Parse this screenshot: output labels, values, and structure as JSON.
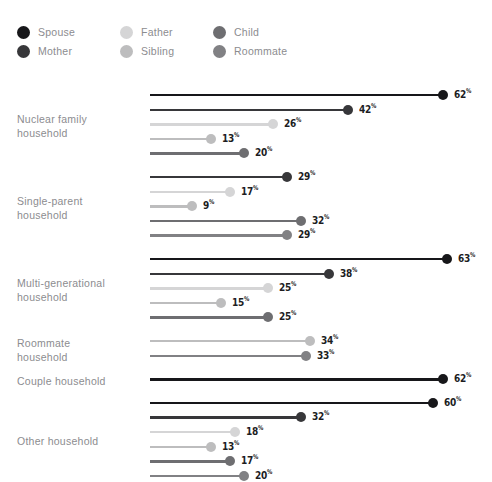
{
  "top_strip": {
    "ghost_text": "— — — —   — — —"
  },
  "legend": {
    "items": [
      {
        "name": "Spouse",
        "color": "#17171a",
        "col": 0,
        "row": 0
      },
      {
        "name": "Mother",
        "color": "#37373a",
        "col": 0,
        "row": 1
      },
      {
        "name": "Father",
        "color": "#d5d5d6",
        "col": 1,
        "row": 0
      },
      {
        "name": "Sibling",
        "color": "#bdbdbe",
        "col": 1,
        "row": 1
      },
      {
        "name": "Child",
        "color": "#6e6e71",
        "col": 2,
        "row": 0
      },
      {
        "name": "Roommate",
        "color": "#818184",
        "col": 2,
        "row": 1
      }
    ]
  },
  "chart_data": {
    "type": "bar",
    "subtype": "lollipop",
    "title": "",
    "xlabel": "",
    "ylabel": "",
    "unit": "%",
    "xlim": [
      0,
      63
    ],
    "grid": false,
    "legend_position": "top-left",
    "series": [
      {
        "name": "Spouse",
        "color": "#17171a"
      },
      {
        "name": "Mother",
        "color": "#37373a"
      },
      {
        "name": "Father",
        "color": "#d5d5d6"
      },
      {
        "name": "Sibling",
        "color": "#bdbdbe"
      },
      {
        "name": "Child",
        "color": "#6e6e71"
      },
      {
        "name": "Roommate",
        "color": "#818184"
      }
    ],
    "groups": [
      {
        "label": "Nuclear family household",
        "label_lines": [
          "Nuclear family",
          "household"
        ],
        "bars": [
          {
            "series": "Spouse",
            "value": 62,
            "value_text": "62"
          },
          {
            "series": "Mother",
            "value": 42,
            "value_text": "42"
          },
          {
            "series": "Father",
            "value": 26,
            "value_text": "26"
          },
          {
            "series": "Sibling",
            "value": 13,
            "value_text": "13"
          },
          {
            "series": "Child",
            "value": 20,
            "value_text": "20"
          }
        ]
      },
      {
        "label": "Single-parent household",
        "label_lines": [
          "Single-parent",
          "household"
        ],
        "bars": [
          {
            "series": "Mother",
            "value": 29,
            "value_text": "29"
          },
          {
            "series": "Father",
            "value": 17,
            "value_text": "17"
          },
          {
            "series": "Sibling",
            "value": 9,
            "value_text": "9"
          },
          {
            "series": "Child",
            "value": 32,
            "value_text": "32"
          },
          {
            "series": "Roommate",
            "value": 29,
            "value_text": "29"
          }
        ]
      },
      {
        "label": "Multi-generational household",
        "label_lines": [
          "Multi-generational",
          "household"
        ],
        "bars": [
          {
            "series": "Spouse",
            "value": 63,
            "value_text": "63"
          },
          {
            "series": "Mother",
            "value": 38,
            "value_text": "38"
          },
          {
            "series": "Father",
            "value": 25,
            "value_text": "25"
          },
          {
            "series": "Sibling",
            "value": 15,
            "value_text": "15"
          },
          {
            "series": "Child",
            "value": 25,
            "value_text": "25"
          }
        ]
      },
      {
        "label": "Roommate household",
        "label_lines": [
          "Roommate",
          "household"
        ],
        "bars": [
          {
            "series": "Sibling",
            "value": 34,
            "value_text": "34"
          },
          {
            "series": "Roommate",
            "value": 33,
            "value_text": "33"
          }
        ]
      },
      {
        "label": "Couple household",
        "label_lines": [
          "Couple household"
        ],
        "bars": [
          {
            "series": "Spouse",
            "value": 62,
            "value_text": "62"
          }
        ]
      },
      {
        "label": "Other household",
        "label_lines": [
          "Other household"
        ],
        "bars": [
          {
            "series": "Spouse",
            "value": 60,
            "value_text": "60"
          },
          {
            "series": "Mother",
            "value": 32,
            "value_text": "32"
          },
          {
            "series": "Father",
            "value": 18,
            "value_text": "18"
          },
          {
            "series": "Sibling",
            "value": 13,
            "value_text": "13"
          },
          {
            "series": "Child",
            "value": 17,
            "value_text": "17"
          },
          {
            "series": "Roommate",
            "value": 20,
            "value_text": "20"
          }
        ]
      }
    ]
  }
}
